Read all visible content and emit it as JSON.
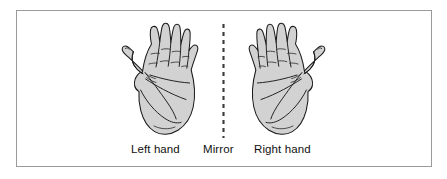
{
  "figure": {
    "background_color": "#ffffff",
    "frame_color": "#9a9a9a",
    "hand_fill_color": "#d2d2d2",
    "hand_outline_color": "#1a1a1a",
    "mirror_line_color": "#3a3a3a",
    "caption_color": "#111111"
  },
  "captions": {
    "left": "Left hand",
    "mirror": "Mirror",
    "right": "Right hand"
  },
  "icons": {
    "left_hand": "left-hand-icon",
    "right_hand": "right-hand-icon",
    "mirror": "mirror-dashed-line-icon"
  }
}
